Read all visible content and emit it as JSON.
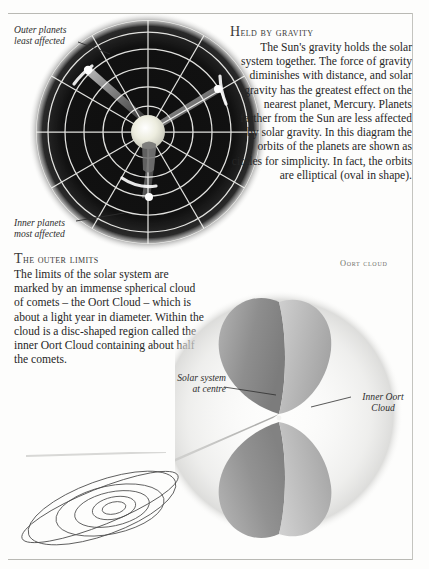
{
  "page": {
    "background_color": "#fdfdfc",
    "rule_color": "#b9b9b4"
  },
  "gravity_diagram": {
    "title_label": "solar-system-gravity-diagram",
    "disc_color": "#121212",
    "orbit_line_color": "#f2f2f0",
    "sun_color": "#f0f0e8",
    "orbit_circle_count": 6,
    "radial_spoke_count": 12,
    "callouts": [
      {
        "name": "outer-planets",
        "line1": "Outer planets",
        "line2": "least affected"
      },
      {
        "name": "inner-planets",
        "line1": "Inner planets",
        "line2": "most affected"
      }
    ]
  },
  "held_by_gravity": {
    "heading_initial": "H",
    "heading_rest": "eld by gravity",
    "body": "The Sun's gravity holds the solar system together. The force of gravity diminishes with distance, and solar gravity has the greatest effect on the nearest planet, Mercury. Planets farther from the Sun are less affected by solar gravity. In this diagram the orbits of the planets are shown as circles for simplicity. In fact, the orbits are elliptical (oval in shape)."
  },
  "outer_limits": {
    "heading_initial": "T",
    "heading_rest": "he outer limits",
    "body": "The limits of the solar system are marked by an immense spherical cloud of comets – the Oort Cloud – which is about a light year in diameter. Within the cloud is a disc-shaped region called the inner Oort Cloud containing about half the comets."
  },
  "oort_illustration": {
    "heading": "Oort cloud",
    "solar_centre_line1": "Solar system",
    "solar_centre_line2": "at centre",
    "inner_oort_line1": "Inner Oort",
    "inner_oort_line2": "Cloud",
    "lobe_color": "#9a9a9a",
    "halo_color": "#dcdcda"
  },
  "comet_inset": {
    "name": "comet-orbit-inset",
    "line_color": "#4a4a4a",
    "ellipse_count": 6
  }
}
